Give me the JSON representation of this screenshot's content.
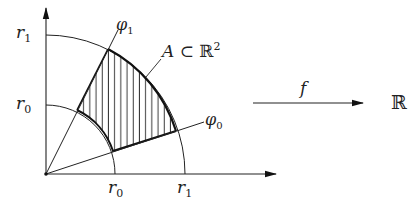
{
  "diagram": {
    "origin": [
      46,
      174
    ],
    "r0": 69,
    "r1": 139,
    "phi0_deg": 18.3,
    "phi1_deg": 63.6,
    "labels": {
      "r1_y": "r",
      "r1_y_sub": "1",
      "r0_y": "r",
      "r0_y_sub": "0",
      "r0_x": "r",
      "r0_x_sub": "0",
      "r1_x": "r",
      "r1_x_sub": "1",
      "phi1": "φ",
      "phi1_sub": "1",
      "phi0": "φ",
      "phi0_sub": "0",
      "region": "A ⊂ ",
      "region_space": "ℝ",
      "region_sup": "2",
      "map": "f",
      "codomain": "ℝ"
    },
    "colors": {
      "ink": "#222222",
      "background": "#ffffff"
    }
  }
}
